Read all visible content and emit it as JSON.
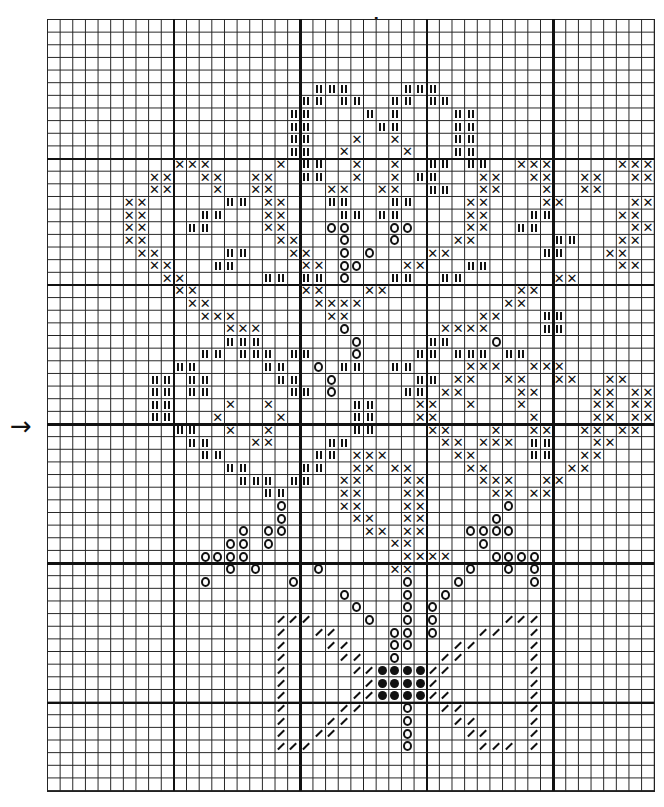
{
  "chart": {
    "type": "cross-stitch-pattern",
    "columns": 48,
    "rows": 61,
    "cell_px": 12.65,
    "thick_line_every": 10,
    "thick_vertical_cols": [
      10,
      20,
      30,
      40
    ],
    "thick_horizontal_rows": [
      11,
      21,
      32,
      43,
      54
    ],
    "center_markers": {
      "top_arrow": "↓",
      "left_arrow": "→",
      "center_col": 25,
      "center_row": 32
    },
    "legend_symbols": {
      "X": "cross",
      "I": "double-bar",
      "O": "circle",
      "D": "filled-dot",
      "S": "slash"
    },
    "grid": [
      "................................................",
      "................................................",
      "................................................",
      "................................................",
      "................................................",
      ".....................III....III.................",
      "....................II.II..II.II................",
      "...................II....I.I....II..............",
      "...................II.....II....II..............",
      "...................II...X..X....II..............",
      "...................II..X....X...II..............",
      "..........XXX.....X.II..X..X..II.II..XXX.....XXX",
      "........XX..XX..XX..II..X..X.II...XX..XX..XX..XX.",
      "........XX...X..XX....XX..XX..II..XX...X..XX....",
      "......XX......II.XX...II...II....XX....XX.....XX",
      "......XX....II...XX....II.II.....XX...II.....XX.",
      "......XX...II....XX...OO...OO....XX..II.......XX",
      "......XX..........XX...O...O....XX......II...XX.",
      ".......XX.....II...XX..O.O....XX.......II...XX..",
      "........XX...II.....XX.OO...XX...II..........XX.",
      ".........XX......II.II.O...II..II.......XX......",
      "..........XX........XX...XX..........XX.........",
      "...........XX........XXXX...........XX..........",
      "............XXX.......XX..........XX...II.......",
      "..............XXX......O.......XXXX....II.......",
      "..............III.......O.....II...O...........",
      "............II.III.II...O....II.III.II..........",
      "..........II.....II..O.II..II....XXX..XXX.......",
      "........II.II.....II..O......II.XX..XX..XX..XX..",
      "........II.II......II.O.....II.XX....XX....XX.XX",
      "........II....X..X......II...XX..X...X.....XX.XX",
      "........II...X....X.....II...XX.......X....XX.XX",
      "..........II..X..X......II....XX...X..XX..XX.XX.",
      "...........II...XX....II.......XX.XXX.II...XX...",
      "............II.......II.XXX.....XX....II..XX....",
      "..............II....II..XX.XX....XX......XX.....",
      "...............III.II..XX...XX....XXX..XX.......",
      ".................II....XX...XX.....XX.XX........",
      "..................O....XX...XX......O...........",
      "..................O.....XX..XX.....O............",
      "...............O.OO......XX.XX...OOOO...........",
      "..............OO.O.........XX.....O.............",
      "............OOOO............XXXX...OOOO.........",
      "..............O.O....O.....XX....O..O.O.........",
      "............O......O........O...O.....O.........",
      ".......................O....O..O................",
      "........................O...O.O.................",
      "..................SSS....O..O.O.....SSS.........",
      "..................S..SS....OO.O...SS..S..........",
      "..................S...SS...OO...SS....S.........",
      "..................S....SS..O...SS.....S.........",
      "..................S.....SSDDDDSS......S.........",
      "..................S......SDDDDS.......S.........",
      "..................S.....SSDDDDSS......S.........",
      "..................S....SS...O..SS.....S.........",
      "..................S...SS....O...SS....S.........",
      "..................S..SS.....O....SS...S.........",
      "..................SSS.......O.....SSS.S.........",
      "................................................",
      "................................................",
      "................................................"
    ]
  }
}
